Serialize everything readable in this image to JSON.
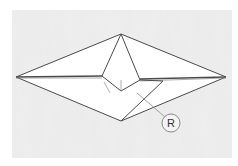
{
  "diagram": {
    "type": "origami-fold-step",
    "label": "R",
    "colors": {
      "background": "#ffffff",
      "paper_texture": "#e4e4e4",
      "line": "#4a4a4a",
      "faint_line": "#9a9a9a",
      "label_circle": "#8a8a8a"
    }
  }
}
